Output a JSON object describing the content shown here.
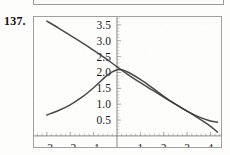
{
  "problem": {
    "number": "137."
  },
  "chart_data": {
    "type": "line",
    "title": "",
    "subtitle": "",
    "xlabel": "",
    "ylabel": "",
    "xlim": [
      -3.55,
      4.45
    ],
    "ylim": [
      -0.35,
      3.75
    ],
    "grid": false,
    "legend": null,
    "axes_style": "centered-cross",
    "x_ticks": [
      -3,
      -2,
      -1,
      1,
      2,
      3,
      4
    ],
    "x_tick_labels": [
      "−3",
      "−2",
      "−1",
      "1",
      "2",
      "3",
      "4"
    ],
    "x_minor_tick_step": 0.2,
    "y_ticks": [
      0.5,
      1.0,
      1.5,
      2.0,
      2.5,
      3.0,
      3.5
    ],
    "y_tick_labels": [
      "0.5",
      "1.0",
      "1.5",
      "2.0",
      "2.5",
      "3.0",
      "3.5"
    ],
    "y_minor_tick_step": 0.1,
    "series": [
      {
        "name": "descending-line",
        "style": "solid",
        "color": "#3a3a3a",
        "x": [
          -3.0,
          -2.5,
          -2.0,
          -1.5,
          -1.0,
          -0.5,
          0.0,
          0.5,
          1.0,
          1.5,
          2.0,
          2.5,
          3.0,
          3.5,
          4.0,
          4.3
        ],
        "y": [
          3.62,
          3.4,
          3.17,
          2.94,
          2.7,
          2.45,
          2.18,
          1.92,
          1.68,
          1.45,
          1.22,
          1.0,
          0.78,
          0.55,
          0.3,
          0.12
        ]
      },
      {
        "name": "peaked-curve",
        "style": "solid",
        "color": "#3a3a3a",
        "x": [
          -3.0,
          -2.5,
          -2.0,
          -1.5,
          -1.0,
          -0.5,
          -0.2,
          0.0,
          0.2,
          0.5,
          1.0,
          1.5,
          2.0,
          2.5,
          3.0,
          3.5,
          4.0,
          4.3
        ],
        "y": [
          0.66,
          0.8,
          0.98,
          1.22,
          1.52,
          1.86,
          2.02,
          2.08,
          2.09,
          2.0,
          1.78,
          1.52,
          1.25,
          1.0,
          0.78,
          0.6,
          0.47,
          0.43
        ]
      }
    ],
    "intersection": {
      "x": 0.05,
      "y": 2.07
    }
  }
}
